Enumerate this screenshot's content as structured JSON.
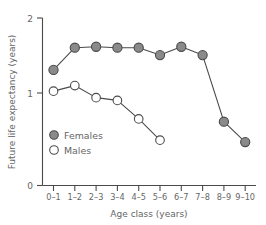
{
  "chart_data": {
    "type": "line",
    "title": "",
    "xlabel": "Age class (years)",
    "ylabel": "Future life expectancy (years)",
    "categories": [
      "0–1",
      "1–2",
      "2–3",
      "3–4",
      "4–5",
      "5–6",
      "6–7",
      "7–8",
      "8–9",
      "9–10"
    ],
    "ylim": [
      0,
      2
    ],
    "yticks": [
      0,
      1,
      2
    ],
    "ytick_labels": [
      "0",
      "1",
      "2"
    ],
    "grid": false,
    "legend_position": "inside-lower-left",
    "series": [
      {
        "name": "Females",
        "marker": "filled-circle",
        "color": "#8a8a8a",
        "values": [
          1.25,
          1.49,
          1.5,
          1.49,
          1.49,
          1.41,
          1.5,
          1.41,
          0.69,
          0.47
        ]
      },
      {
        "name": "Males",
        "marker": "open-circle",
        "color": "#ffffff",
        "values": [
          1.02,
          1.08,
          0.95,
          0.92,
          0.72,
          0.49,
          null,
          null,
          null,
          null
        ]
      }
    ]
  },
  "legend": {
    "items": [
      {
        "label": "Females",
        "marker": "filled-circle"
      },
      {
        "label": "Males",
        "marker": "open-circle"
      }
    ]
  },
  "axes": {
    "y_title": "Future life expectancy (years)",
    "x_title": "Age class (years)",
    "y_tick_top": "2",
    "y_tick_mid": "1",
    "y_tick_bottom": "0"
  }
}
